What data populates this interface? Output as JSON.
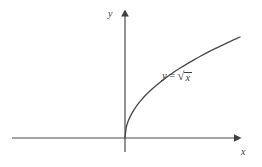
{
  "figure": {
    "background_color": "#ffffff",
    "stroke_color": "#4a4a4a",
    "text_color": "#3c3c3c"
  },
  "labels": {
    "y_axis": "y",
    "x_axis": "x",
    "equation_lhs": "y",
    "equation_relation": "=",
    "equation_radical_sign": "√",
    "equation_radicand": "x",
    "equation_full": "y = √x"
  },
  "chart_data": {
    "type": "line",
    "title": "",
    "subtitle": "",
    "xlabel": "x",
    "ylabel": "y",
    "annotations": [
      {
        "text": "y = √x",
        "x": 162,
        "y": 71
      }
    ],
    "legend": [],
    "legend_position": "none",
    "grid": false,
    "axis_arrows": true,
    "xlim": [
      -9.2,
      8.5
    ],
    "ylim": [
      -0.55,
      4.7
    ],
    "xticks": [],
    "yticks": [],
    "series": [
      {
        "name": "y = √x",
        "color": "#4a4a4a",
        "x": [
          0,
          0.1,
          0.25,
          0.5,
          0.75,
          1,
          1.5,
          2,
          2.5,
          3,
          3.5,
          4,
          4.5,
          5,
          5.5,
          6,
          6.5,
          7,
          7.5,
          8,
          8.4
        ],
        "y": [
          0,
          0.316,
          0.5,
          0.707,
          0.866,
          1,
          1.225,
          1.414,
          1.581,
          1.732,
          1.871,
          2,
          2.121,
          2.236,
          2.345,
          2.449,
          2.55,
          2.646,
          2.739,
          2.828,
          2.898
        ]
      }
    ]
  },
  "geometry": {
    "origin": {
      "x": 125,
      "y": 138
    },
    "x_axis": {
      "x1": 12,
      "x2": 240,
      "y": 138
    },
    "y_axis": {
      "x": 125,
      "y1": 152,
      "y2": 11
    },
    "curve_end": {
      "x": 240,
      "y": 37
    },
    "unit_x": 13.69,
    "unit_y": 34.85
  }
}
